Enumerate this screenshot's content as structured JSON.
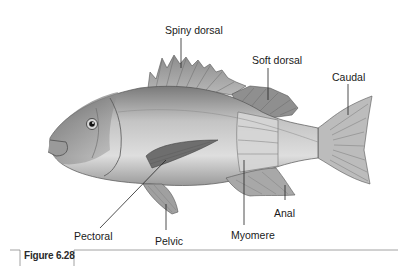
{
  "diagram": {
    "labels": {
      "spiny_dorsal": "Spiny dorsal",
      "soft_dorsal": "Soft dorsal",
      "caudal": "Caudal",
      "pectoral": "Pectoral",
      "pelvic": "Pelvic",
      "myomere": "Myomere",
      "anal": "Anal"
    },
    "figure_caption": "Figure 6.28"
  },
  "colors": {
    "background": "#ffffff",
    "fish_dark": "#6e6e6e",
    "fish_mid": "#a6a6a6",
    "fish_light": "#dcdcdc",
    "leader_line": "#222222",
    "frame_line": "#8a8a8a"
  }
}
